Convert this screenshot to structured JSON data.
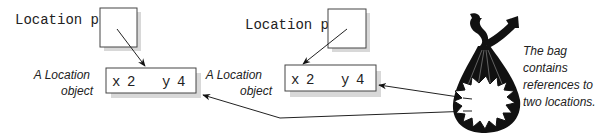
{
  "diagram": {
    "variables": [
      {
        "label": "Location p1"
      },
      {
        "label": "Location p2"
      }
    ],
    "objects": [
      {
        "caption_line1": "A Location",
        "caption_line2": "object",
        "x_label": "x",
        "x_value": "2",
        "y_label": "y",
        "y_value": "4"
      },
      {
        "caption_line1": "A Location",
        "caption_line2": "object",
        "x_label": "x",
        "x_value": "2",
        "y_label": "y",
        "y_value": "4"
      }
    ],
    "bag": {
      "icon": "bag-icon",
      "caption_lines": [
        "The bag",
        "contains",
        "references to",
        "two locations."
      ]
    },
    "colors": {
      "line": "#222222",
      "shadow": "#d8d8d8",
      "box_fill": "#ffffff",
      "bag": "#111111"
    }
  }
}
